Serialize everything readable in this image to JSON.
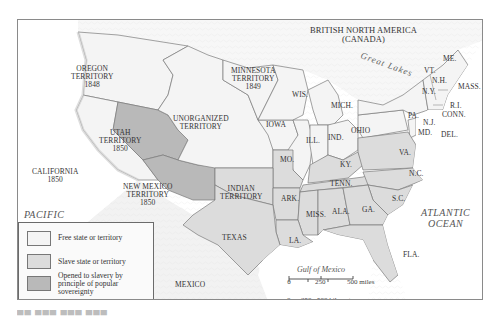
{
  "map": {
    "colors": {
      "free": "#f4f4f4",
      "slave": "#dcdcdc",
      "popular_sovereignty": "#b9b9b9",
      "border": "#7a7a7a",
      "frame": "#8a8a8a",
      "water": "#ffffff"
    },
    "regions": {
      "british_north_america": [
        "BRITISH NORTH AMERICA",
        "(CANADA)"
      ],
      "oregon": [
        "OREGON",
        "TERRITORY",
        "1848"
      ],
      "minnesota": [
        "MINNESOTA",
        "TERRITORY",
        "1849"
      ],
      "unorganized": [
        "UNORGANIZED",
        "TERRITORY"
      ],
      "utah": [
        "UTAH",
        "TERRITORY",
        "1850"
      ],
      "california": [
        "CALIFORNIA",
        "1850"
      ],
      "new_mexico": [
        "NEW MEXICO",
        "TERRITORY",
        "1850"
      ],
      "indian": [
        "INDIAN",
        "TERRITORY"
      ],
      "texas": "TEXAS",
      "mexico": "MEXICO"
    },
    "states": {
      "wis": "WIS.",
      "iowa": "IOWA",
      "mich": "MICH.",
      "ill": "ILL.",
      "ind": "IND.",
      "ohio": "OHIO",
      "mo": "MO.",
      "ky": "KY.",
      "ark": "ARK.",
      "tenn": "TENN.",
      "miss": "MISS.",
      "ala": "ALA.",
      "ga": "GA.",
      "la": "LA.",
      "fla": "FLA.",
      "sc": "S.C.",
      "nc": "N.C.",
      "va": "VA.",
      "md": "MD.",
      "del": "DEL.",
      "nj": "N.J.",
      "pa": "PA.",
      "ny": "N.Y.",
      "conn": "CONN.",
      "ri": "R.I.",
      "mass": "MASS.",
      "nh": "N.H.",
      "vt": "VT.",
      "me": "ME."
    },
    "water": {
      "pacific": [
        "PACIFIC",
        "OCEAN"
      ],
      "atlantic": [
        "ATLANTIC",
        "OCEAN"
      ],
      "gulf": "Gulf of Mexico",
      "great_lakes": "Great Lakes"
    },
    "legend": {
      "items": [
        {
          "label": "Free state or territory",
          "color": "#f4f4f4"
        },
        {
          "label": "Slave state or territory",
          "color": "#dcdcdc"
        },
        {
          "label_lines": [
            "Opened to slavery by",
            "principle of popular",
            "sovereignty"
          ],
          "color": "#b9b9b9"
        }
      ]
    },
    "scale": {
      "miles": {
        "ticks": [
          "0",
          "250",
          "500 miles"
        ]
      },
      "kilometers": {
        "ticks": [
          "0",
          "250",
          "500 kilometers"
        ]
      }
    }
  }
}
